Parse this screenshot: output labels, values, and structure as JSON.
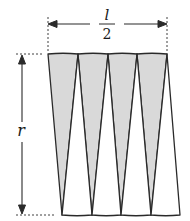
{
  "figure": {
    "labels": {
      "width_numerator": "l",
      "width_denominator": "2",
      "height": "r"
    },
    "colors": {
      "fill": "#d9d9d9",
      "stroke": "#2a2a2a",
      "background": "#ffffff"
    },
    "sector_count": 8
  }
}
